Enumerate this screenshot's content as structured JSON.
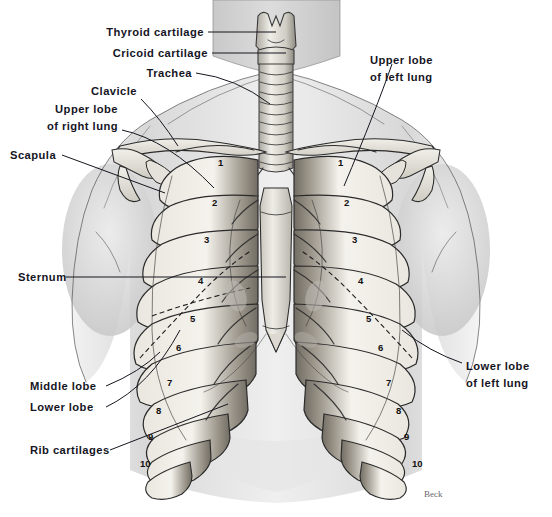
{
  "figure": {
    "signature": "Beck",
    "background_color": "#ffffff",
    "ink_color": "#2b2b2b",
    "label_color": "#15151f"
  },
  "labels_left": [
    {
      "id": "thyroid-cartilage",
      "text": "Thyroid cartilage"
    },
    {
      "id": "cricoid-cartilage",
      "text": "Cricoid cartilage"
    },
    {
      "id": "trachea",
      "text": "Trachea"
    },
    {
      "id": "clavicle",
      "text": "Clavicle"
    },
    {
      "id": "upper-lobe-right-lung-1",
      "text": "Upper lobe"
    },
    {
      "id": "upper-lobe-right-lung-2",
      "text": "of right lung"
    },
    {
      "id": "scapula",
      "text": "Scapula"
    },
    {
      "id": "sternum",
      "text": "Sternum"
    },
    {
      "id": "middle-lobe",
      "text": "Middle lobe"
    },
    {
      "id": "lower-lobe",
      "text": "Lower lobe"
    },
    {
      "id": "rib-cartilages",
      "text": "Rib cartilages"
    }
  ],
  "labels_right": [
    {
      "id": "upper-lobe-left-lung-1",
      "text": "Upper  lobe"
    },
    {
      "id": "upper-lobe-left-lung-2",
      "text": "of left lung"
    },
    {
      "id": "lower-lobe-left-lung-1",
      "text": "Lower  lobe"
    },
    {
      "id": "lower-lobe-left-lung-2",
      "text": "of left lung"
    }
  ],
  "rib_numbers_right_lung": [
    "1",
    "2",
    "3",
    "4",
    "5",
    "6",
    "7",
    "8",
    "9",
    "10"
  ],
  "rib_numbers_left_lung": [
    "1",
    "2",
    "3",
    "4",
    "5",
    "6",
    "7",
    "8",
    "9",
    "10"
  ]
}
